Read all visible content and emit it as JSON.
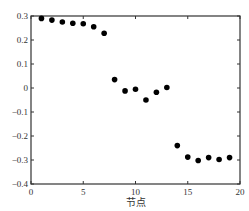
{
  "chart_data": {
    "type": "scatter",
    "title": "",
    "xlabel": "节点",
    "ylabel": "",
    "xlim": [
      0,
      20
    ],
    "ylim": [
      -0.4,
      0.3
    ],
    "xticks": [
      0,
      5,
      10,
      15,
      20
    ],
    "yticks": [
      0.3,
      0.2,
      0.1,
      0,
      -0.1,
      -0.2,
      -0.3,
      -0.4
    ],
    "xtick_labels": [
      "0",
      "5",
      "10",
      "15",
      "20"
    ],
    "ytick_labels": [
      "0.3",
      "0.2",
      "0.1",
      "0",
      "−0.1",
      "−0.2",
      "−0.3",
      "−0.4"
    ],
    "grid": false,
    "legend": null,
    "series": [
      {
        "name": "nodes",
        "color": "#000000",
        "x": [
          1,
          2,
          3,
          4,
          5,
          6,
          7,
          8,
          9,
          10,
          11,
          12,
          13,
          14,
          15,
          16,
          17,
          18,
          19
        ],
        "y": [
          0.29,
          0.283,
          0.275,
          0.27,
          0.268,
          0.255,
          0.228,
          0.035,
          -0.012,
          -0.005,
          -0.05,
          -0.018,
          0.002,
          -0.24,
          -0.288,
          -0.302,
          -0.29,
          -0.298,
          -0.29
        ]
      }
    ]
  }
}
